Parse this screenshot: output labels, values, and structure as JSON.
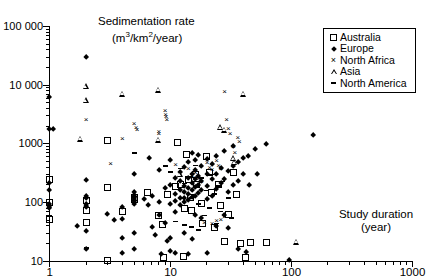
{
  "chart_data": {
    "type": "scatter",
    "title": "",
    "ylabel": "Sedimentation rate (m3/km2/year)",
    "ylabel_line1": "Sedimentation rate",
    "ylabel_line2_pre": "(m",
    "ylabel_line2_sup1": "3",
    "ylabel_line2_mid": "/km",
    "ylabel_line2_sup2": "2",
    "ylabel_line2_post": "/year)",
    "xlabel": "Study duration (year)",
    "xlabel_line1": "Study duration",
    "xlabel_line2": "(year)",
    "xscale": "log",
    "yscale": "log",
    "xlim": [
      1,
      1000
    ],
    "ylim": [
      10,
      100000
    ],
    "xticks": [
      1,
      10,
      100,
      1000
    ],
    "xticklabels": [
      "1",
      "10",
      "100",
      "1000"
    ],
    "yticks": [
      10,
      100,
      1000,
      10000,
      100000
    ],
    "yticklabels": [
      "10",
      "100",
      "1000",
      "10 000",
      "100 000"
    ],
    "grid": false,
    "legend_position": "top-right",
    "marker_color": "#000000",
    "background_color": "#ffffff",
    "legend": [
      {
        "label": "Australia",
        "marker": "open-square"
      },
      {
        "label": "Europe",
        "marker": "filled-diamond"
      },
      {
        "label": "North Africa",
        "marker": "cross",
        "glyph": "×"
      },
      {
        "label": "Asia",
        "marker": "open-triangle"
      },
      {
        "label": "North America",
        "marker": "dash",
        "glyph": "-"
      }
    ],
    "series": [
      {
        "name": "Australia",
        "marker": "open-square",
        "points": [
          [
            1,
            250
          ],
          [
            1,
            100
          ],
          [
            1,
            52
          ],
          [
            2,
            110
          ],
          [
            2,
            72
          ],
          [
            2,
            45
          ],
          [
            3,
            180
          ],
          [
            3,
            1150
          ],
          [
            3,
            10.5
          ],
          [
            4,
            70
          ],
          [
            5,
            120
          ],
          [
            5,
            115
          ],
          [
            6.5,
            150
          ],
          [
            8,
            60
          ],
          [
            8.6,
            42
          ],
          [
            8.8,
            11.5
          ],
          [
            9.5,
            135
          ],
          [
            11,
            190
          ],
          [
            11.5,
            1050
          ],
          [
            12,
            200
          ],
          [
            12.8,
            12
          ],
          [
            13,
            80
          ],
          [
            13.5,
            660
          ],
          [
            14,
            250
          ],
          [
            14.5,
            120
          ],
          [
            15,
            74
          ],
          [
            16,
            300
          ],
          [
            16.5,
            200
          ],
          [
            18,
            95
          ],
          [
            18.5,
            44
          ],
          [
            20,
            610
          ],
          [
            21,
            330
          ],
          [
            22,
            150
          ],
          [
            23,
            38
          ],
          [
            25,
            205
          ],
          [
            26,
            90
          ],
          [
            28,
            22
          ],
          [
            30,
            63
          ],
          [
            33,
            330
          ],
          [
            35,
            140
          ],
          [
            38,
            20
          ],
          [
            42,
            11.5
          ],
          [
            46,
            21
          ],
          [
            62,
            21
          ]
        ]
      },
      {
        "name": "Europe",
        "marker": "filled-diamond",
        "points": [
          [
            1,
            6200
          ],
          [
            1,
            1800
          ],
          [
            1.07,
            1800
          ],
          [
            1,
            210
          ],
          [
            1,
            160
          ],
          [
            1,
            95
          ],
          [
            1,
            85
          ],
          [
            1,
            80
          ],
          [
            2,
            30000
          ],
          [
            2,
            240
          ],
          [
            2,
            130
          ],
          [
            2,
            120
          ],
          [
            2,
            95
          ],
          [
            2,
            88
          ],
          [
            2,
            82
          ],
          [
            2,
            33
          ],
          [
            2,
            16
          ],
          [
            1.7,
            40
          ],
          [
            3,
            64
          ],
          [
            3.4,
            50
          ],
          [
            4,
            85
          ],
          [
            4,
            52
          ],
          [
            4,
            25
          ],
          [
            4,
            14
          ],
          [
            5,
            300
          ],
          [
            5,
            150
          ],
          [
            5,
            135
          ],
          [
            5,
            125
          ],
          [
            5,
            118
          ],
          [
            5,
            110
          ],
          [
            5,
            100
          ],
          [
            5,
            95
          ],
          [
            5,
            30
          ],
          [
            5,
            16
          ],
          [
            6,
            115
          ],
          [
            6.5,
            90
          ],
          [
            6.6,
            560
          ],
          [
            7,
            130
          ],
          [
            7,
            38
          ],
          [
            7.5,
            28
          ],
          [
            8,
            350
          ],
          [
            8,
            100
          ],
          [
            8,
            60
          ],
          [
            8.3,
            13
          ],
          [
            9,
            175
          ],
          [
            9,
            44
          ],
          [
            9.3,
            22
          ],
          [
            10,
            520
          ],
          [
            10,
            200
          ],
          [
            10,
            95
          ],
          [
            10,
            25
          ],
          [
            10,
            15
          ],
          [
            11,
            265
          ],
          [
            11,
            140
          ],
          [
            11,
            105
          ],
          [
            11,
            70
          ],
          [
            11,
            13.5
          ],
          [
            12,
            330
          ],
          [
            12,
            230
          ],
          [
            12,
            160
          ],
          [
            12,
            118
          ],
          [
            12,
            92
          ],
          [
            13,
            400
          ],
          [
            13,
            190
          ],
          [
            13,
            150
          ],
          [
            13,
            120
          ],
          [
            13,
            100
          ],
          [
            13,
            30
          ],
          [
            14,
            480
          ],
          [
            14,
            260
          ],
          [
            14,
            175
          ],
          [
            14,
            140
          ],
          [
            14,
            110
          ],
          [
            14,
            13
          ],
          [
            15,
            700
          ],
          [
            15,
            300
          ],
          [
            15,
            210
          ],
          [
            15,
            160
          ],
          [
            15,
            125
          ],
          [
            15,
            24
          ],
          [
            16,
            520
          ],
          [
            16,
            350
          ],
          [
            16,
            250
          ],
          [
            16,
            180
          ],
          [
            16,
            130
          ],
          [
            16,
            60
          ],
          [
            17,
            640
          ],
          [
            17,
            280
          ],
          [
            17,
            200
          ],
          [
            17,
            145
          ],
          [
            18,
            420
          ],
          [
            18,
            230
          ],
          [
            18,
            165
          ],
          [
            18,
            55
          ],
          [
            20,
            540
          ],
          [
            20,
            310
          ],
          [
            20,
            190
          ],
          [
            20,
            115
          ],
          [
            20,
            14
          ],
          [
            22,
            460
          ],
          [
            22,
            250
          ],
          [
            22,
            130
          ],
          [
            24,
            620
          ],
          [
            24,
            300
          ],
          [
            24,
            170
          ],
          [
            24,
            40
          ],
          [
            26,
            390
          ],
          [
            26,
            210
          ],
          [
            28,
            760
          ],
          [
            28,
            250
          ],
          [
            28,
            60
          ],
          [
            30,
            340
          ],
          [
            30,
            150
          ],
          [
            30,
            36
          ],
          [
            33,
            900
          ],
          [
            33,
            420
          ],
          [
            33,
            200
          ],
          [
            36,
            480
          ],
          [
            36,
            230
          ],
          [
            36,
            16
          ],
          [
            40,
            560
          ],
          [
            40,
            300
          ],
          [
            42,
            14.5
          ],
          [
            44,
            620
          ],
          [
            45,
            200
          ],
          [
            50,
            820
          ],
          [
            52,
            300
          ],
          [
            62,
            980
          ],
          [
            95,
            10.5
          ],
          [
            150,
            1400
          ]
        ]
      },
      {
        "name": "North Africa",
        "marker": "cross",
        "points": [
          [
            2,
            2600
          ],
          [
            4,
            1250
          ],
          [
            5,
            2200
          ],
          [
            5.2,
            1900
          ],
          [
            5.3,
            1750
          ],
          [
            3.2,
            460
          ],
          [
            8,
            1600
          ],
          [
            8,
            1500
          ],
          [
            9,
            3700
          ],
          [
            9.1,
            3200
          ],
          [
            9.2,
            2900
          ],
          [
            9.3,
            2600
          ],
          [
            11,
            440
          ],
          [
            14,
            380
          ],
          [
            15,
            290
          ],
          [
            16,
            320
          ],
          [
            17,
            260
          ],
          [
            18,
            230
          ],
          [
            20,
            480
          ],
          [
            21,
            400
          ],
          [
            22,
            360
          ],
          [
            24,
            520
          ],
          [
            25,
            430
          ],
          [
            26,
            380
          ],
          [
            28,
            7900
          ],
          [
            29,
            2600
          ],
          [
            30,
            1800
          ],
          [
            31,
            1500
          ],
          [
            33,
            900
          ],
          [
            34,
            700
          ],
          [
            36,
            1300
          ],
          [
            37,
            1100
          ],
          [
            19,
            46
          ],
          [
            22,
            44
          ],
          [
            24,
            50
          ],
          [
            26,
            52
          ],
          [
            28,
            58
          ]
        ]
      },
      {
        "name": "Asia",
        "marker": "open-triangle",
        "points": [
          [
            2,
            9400
          ],
          [
            2,
            5500
          ],
          [
            4,
            7000
          ],
          [
            1.8,
            1200
          ],
          [
            8,
            8200
          ],
          [
            8,
            1150
          ],
          [
            12,
            300
          ],
          [
            26,
            1900
          ],
          [
            28,
            1700
          ],
          [
            33,
            560
          ],
          [
            34,
            480
          ],
          [
            40,
            7000
          ],
          [
            110,
            21
          ]
        ]
      },
      {
        "name": "North America",
        "marker": "dash",
        "points": [
          [
            1,
            60
          ],
          [
            2,
            17
          ],
          [
            5,
            700
          ],
          [
            9,
            420
          ],
          [
            10,
            330
          ],
          [
            12,
            380
          ],
          [
            13,
            210
          ],
          [
            14,
            270
          ],
          [
            15,
            120
          ],
          [
            16,
            430
          ],
          [
            17,
            95
          ],
          [
            18,
            260
          ],
          [
            19,
            60
          ],
          [
            20,
            160
          ],
          [
            21,
            80
          ],
          [
            22,
            300
          ],
          [
            23,
            140
          ],
          [
            24,
            44
          ],
          [
            25,
            190
          ],
          [
            26,
            70
          ],
          [
            27,
            230
          ],
          [
            13,
            42
          ],
          [
            15,
            38
          ],
          [
            17,
            34
          ],
          [
            11,
            48
          ],
          [
            30,
            120
          ],
          [
            32,
            55
          ]
        ]
      }
    ]
  }
}
